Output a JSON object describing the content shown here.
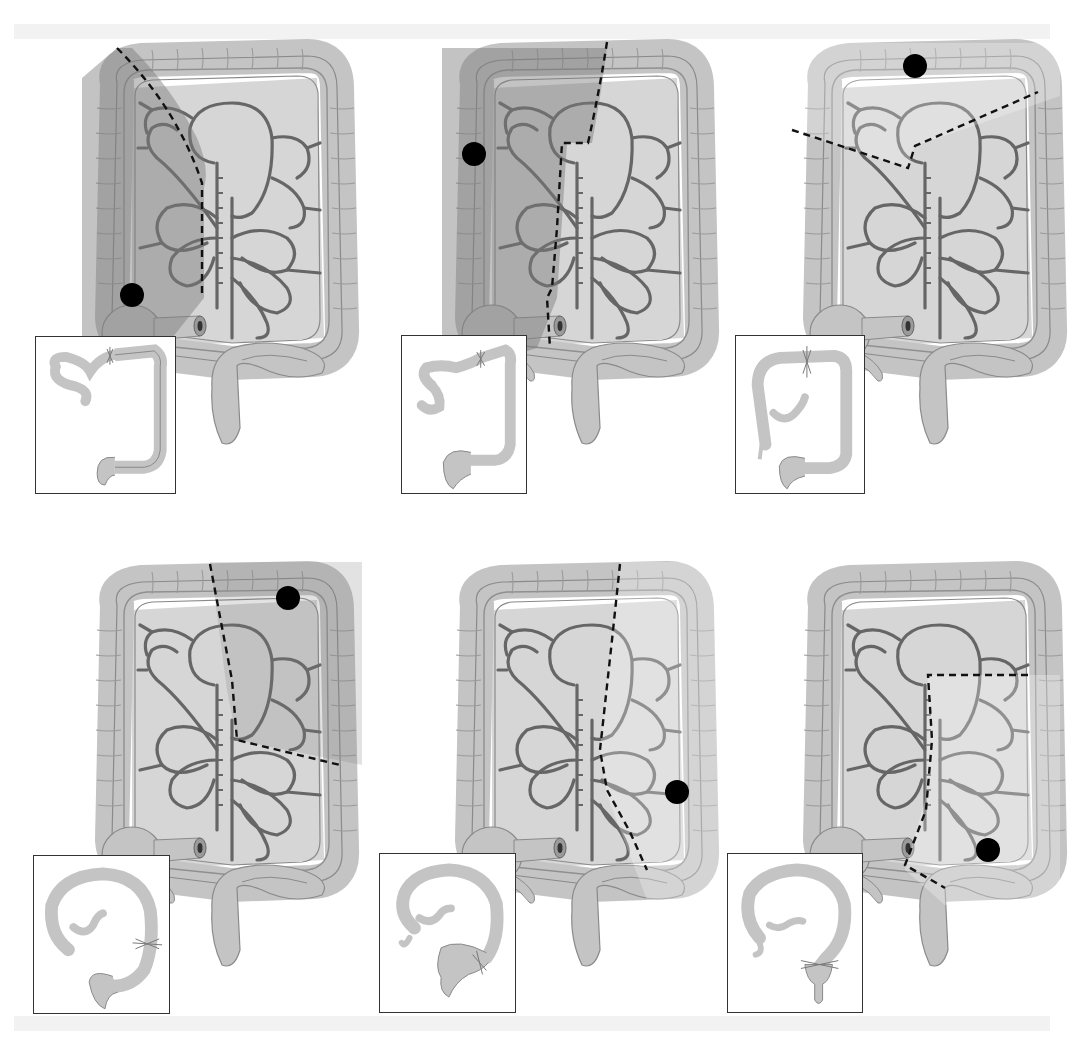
{
  "figure": {
    "colors": {
      "colon_fill": "#c4c4c4",
      "colon_outline": "#8a8a8a",
      "resected_fill": "#8e8e8e",
      "mesentery_fill": "#d6d6d6",
      "vessel": "#666666",
      "tumor": "#000000",
      "resection_line": "#111111",
      "background_band": "#f2f2f2"
    },
    "panels": [
      {
        "id": "right-hemicolectomy",
        "label": "Right hemicolectomy",
        "tumor_location": "cecum",
        "resected_region": "cecum and ascending colon",
        "inset": "ileum anastomosed to transverse colon"
      },
      {
        "id": "extended-right-hemicolectomy",
        "label": "Extended right hemicolectomy",
        "tumor_location": "hepatic flexure / ascending colon",
        "resected_region": "right colon and proximal transverse colon",
        "inset": "ileum anastomosed to distal transverse colon"
      },
      {
        "id": "transverse-colectomy",
        "label": "Transverse colectomy",
        "tumor_location": "transverse colon",
        "resected_region": "transverse colon",
        "inset": "transverse anastomosis"
      },
      {
        "id": "left-hemicolectomy",
        "label": "Left hemicolectomy",
        "tumor_location": "splenic flexure",
        "resected_region": "distal transverse and upper descending colon",
        "inset": "transverse colon anastomosed to descending colon"
      },
      {
        "id": "extended-left-hemicolectomy",
        "label": "Left hemicolectomy (descending)",
        "tumor_location": "descending colon",
        "resected_region": "descending colon",
        "inset": "colon anastomosed to sigmoid"
      },
      {
        "id": "sigmoid-colectomy",
        "label": "Sigmoid colectomy",
        "tumor_location": "sigmoid colon",
        "resected_region": "sigmoid colon",
        "inset": "colon anastomosed to rectum"
      }
    ]
  }
}
